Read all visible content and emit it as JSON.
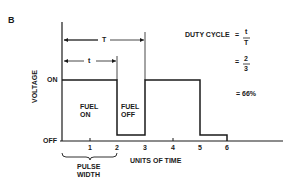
{
  "figure": {
    "panel_label": "B",
    "y_axis_label": "VOLTAGE",
    "x_axis_label": "UNITS OF TIME",
    "level_on": "ON",
    "level_off": "OFF",
    "x_ticks": [
      "1",
      "2",
      "3",
      "4",
      "5",
      "6"
    ],
    "period_label": "T",
    "pulse_label": "t",
    "fuel_on": [
      "FUEL",
      "ON"
    ],
    "fuel_off": [
      "FUEL",
      "OFF"
    ],
    "pulse_width": [
      "PULSE",
      "WIDTH"
    ],
    "duty_cycle": {
      "label": "DUTY CYCLE",
      "eq": "=",
      "frac1_num": "t",
      "frac1_den": "T",
      "frac2_num": "2",
      "frac2_den": "3",
      "result": "= 66%"
    }
  },
  "colors": {
    "line": "#1a1a1a",
    "background": "#ffffff"
  }
}
